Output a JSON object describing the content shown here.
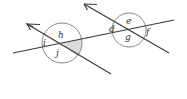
{
  "diagram": {
    "colors": {
      "line": "#3a3a3a",
      "circle": "#8a8a8a",
      "shade": "#d9d9d9",
      "label": "#333333"
    },
    "left_intersection": {
      "labels": {
        "top": "h",
        "left": "i",
        "bottom": "j"
      },
      "shaded_angle": "right"
    },
    "right_intersection": {
      "labels": {
        "top": "e",
        "left": "d",
        "bottom": "g",
        "right": "f"
      }
    }
  }
}
